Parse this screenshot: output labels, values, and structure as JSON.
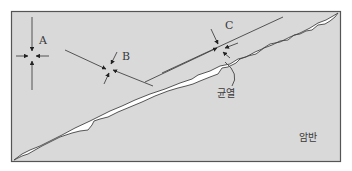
{
  "diagram": {
    "type": "stress-in-rock-crack-schematic",
    "colors": {
      "background": "#ffffff",
      "rock_fill": "#d9d9d9",
      "frame_stroke": "#555555",
      "crack_fill": "#ffffff",
      "line_stroke": "#444444",
      "text": "#3a3a3a"
    },
    "labels": {
      "point_a": "A",
      "point_b": "B",
      "point_c": "C",
      "crack": "균열",
      "rock": "암반"
    },
    "stress_points": [
      {
        "id": "A",
        "description": "stress concentration point far from crack, compressive arrows from four directions"
      },
      {
        "id": "B",
        "description": "oblique stress point between lines, compressive arrows inward"
      },
      {
        "id": "C",
        "description": "stress point at crack tip region, compressive arrows inward"
      }
    ]
  }
}
